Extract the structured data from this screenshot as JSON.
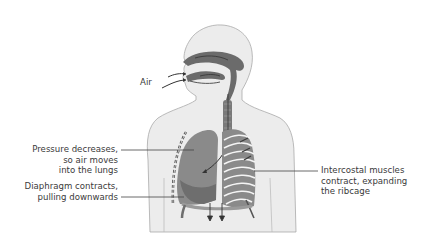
{
  "diagram": {
    "colors": {
      "body_fill": "#ececec",
      "body_outline": "#a9a9a9",
      "airway": "#6b6b6b",
      "lung": "#8a8a8a",
      "lung_dark": "#6e6e6e",
      "ribs": "#f4f4f4",
      "leader_line": "#444444",
      "text": "#3a3a3a"
    },
    "labels": {
      "air": "Air",
      "pressure": {
        "line1": "Pressure decreases,",
        "line2": "so air moves",
        "line3": "into the lungs"
      },
      "diaphragm": {
        "line1": "Diaphragm contracts,",
        "line2": "pulling downwards"
      },
      "intercostal": {
        "line1": "Intercostal muscles",
        "line2": "contract, expanding",
        "line3": "the ribcage"
      }
    }
  }
}
